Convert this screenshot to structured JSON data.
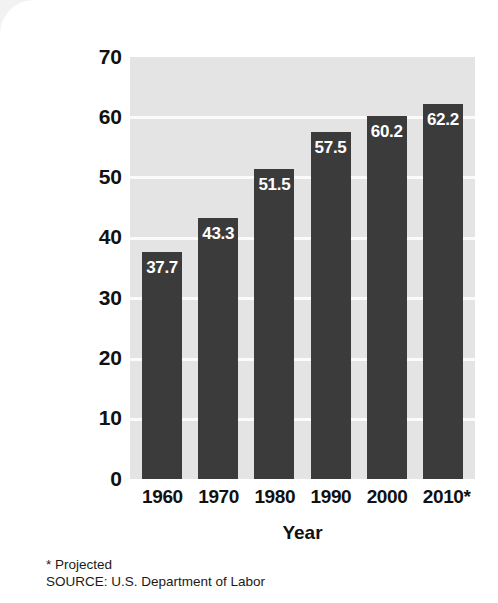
{
  "chart_data": {
    "type": "bar",
    "title": "",
    "xlabel": "Year",
    "ylabel": "Percentage of all women",
    "categories": [
      "1960",
      "1970",
      "1980",
      "1990",
      "2000",
      "2010*"
    ],
    "values": [
      37.7,
      43.3,
      51.5,
      57.5,
      60.2,
      62.2
    ],
    "value_labels": [
      "37.7",
      "43.3",
      "51.5",
      "57.5",
      "60.2",
      "62.2"
    ],
    "ylim": [
      0,
      70
    ],
    "yticks": [
      70,
      60,
      50,
      40,
      30,
      20,
      10,
      0
    ],
    "ytick_labels": [
      "70",
      "60",
      "50",
      "40",
      "30",
      "20",
      "10",
      "0"
    ],
    "grid": true,
    "legend": "none",
    "colors": {
      "bar": "#3b3b3b",
      "plot_background": "#e4e4e4",
      "gridline": "#fbfbfb",
      "text": "#111111",
      "value_label": "#ffffff",
      "page_background": "#ffffff"
    }
  },
  "footnotes": {
    "projected": "* Projected",
    "source": "SOURCE: U.S. Department of Labor"
  }
}
